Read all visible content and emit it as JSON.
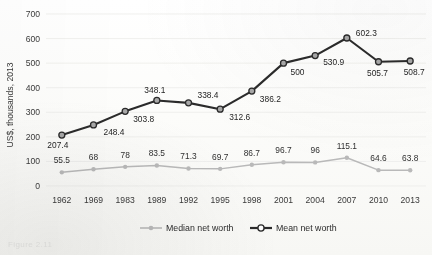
{
  "chart_data": {
    "type": "line",
    "title": "",
    "xlabel": "",
    "ylabel": "US$, thousands, 2013",
    "ylim": [
      0,
      700
    ],
    "yticks": [
      0,
      100,
      200,
      300,
      400,
      500,
      600,
      700
    ],
    "grid": true,
    "legend_position": "bottom-center",
    "categories": [
      "1962",
      "1969",
      "1983",
      "1989",
      "1992",
      "1995",
      "1998",
      "2001",
      "2004",
      "2007",
      "2010",
      "2013"
    ],
    "series": [
      {
        "name": "Median net worth",
        "color": "#b9b9b9",
        "marker": "circle-small-filled",
        "values": [
          55.5,
          68,
          78,
          83.5,
          71.3,
          69.7,
          86.7,
          96.7,
          96,
          115.1,
          64.6,
          63.8
        ],
        "labels": [
          "55.5",
          "68",
          "78",
          "83.5",
          "71.3",
          "69.7",
          "86.7",
          "96.7",
          "96",
          "115.1",
          "64.6",
          "63.8"
        ]
      },
      {
        "name": "Mean net worth",
        "color": "#2b2b2b",
        "marker": "circle-gray-fill-dark-outline",
        "values": [
          207.4,
          248.4,
          303.8,
          348.1,
          338.4,
          312.6,
          386.2,
          500,
          530.9,
          602.3,
          505.7,
          508.7
        ],
        "labels": [
          "207.4",
          "248.4",
          "303.8",
          "348.1",
          "338.4",
          "312.6",
          "386.2",
          "500",
          "530.9",
          "602.3",
          "505.7",
          "508.7"
        ]
      }
    ]
  },
  "axis": {
    "y_label": "US$, thousands, 2013",
    "y_ticks": [
      "0",
      "100",
      "200",
      "300",
      "400",
      "500",
      "600",
      "700"
    ],
    "x_ticks": [
      "1962",
      "1969",
      "1983",
      "1989",
      "1992",
      "1995",
      "1998",
      "2001",
      "2004",
      "2007",
      "2010",
      "2013"
    ]
  },
  "legend": {
    "items": [
      {
        "label": "Median net worth",
        "color": "#b9b9b9"
      },
      {
        "label": "Mean net worth",
        "color": "#2b2b2b"
      }
    ]
  },
  "caption": {
    "text": "Figure 2.11"
  }
}
